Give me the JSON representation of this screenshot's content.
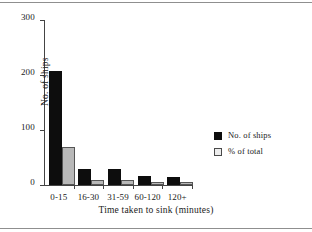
{
  "chart_data": {
    "type": "bar",
    "title": "",
    "xlabel": "Time taken to sink (minutes)",
    "ylabel": "No. of ships",
    "categories": [
      "0-15",
      "16-30",
      "31-59",
      "60-120",
      "120+"
    ],
    "series": [
      {
        "name": "No. of ships",
        "color": "#0d0d0d",
        "values": [
          207,
          29,
          30,
          17,
          15
        ]
      },
      {
        "name": "% of total",
        "color": "#b8b8b8",
        "values": [
          69,
          10,
          10,
          6,
          5
        ]
      }
    ],
    "ylim": [
      0,
      300
    ],
    "yticks": [
      0,
      100,
      200,
      300
    ],
    "ytick_labels": [
      "0",
      "100",
      "200",
      "300"
    ],
    "grid": false,
    "legend_position": "right"
  },
  "legend": {
    "entries": [
      {
        "label": "No. of ships",
        "swatch": "filled-black-square"
      },
      {
        "label": "% of total",
        "swatch": "outlined-light-square"
      }
    ]
  },
  "colors": {
    "series_0": "#0d0d0d",
    "series_1": "#b8b8b8",
    "axis": "#444444",
    "background": "#ffffff",
    "rule": "#8f8f8f"
  }
}
